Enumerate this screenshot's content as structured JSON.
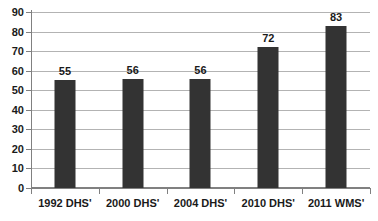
{
  "chart_data": {
    "type": "bar",
    "title": "",
    "subtitle": "",
    "xlabel": "",
    "ylabel": "",
    "categories": [
      "1992 DHS'",
      "2000 DHS'",
      "2004 DHS'",
      "2010 DHS'",
      "2011 WMS'"
    ],
    "values": [
      55,
      56,
      56,
      72,
      83
    ],
    "data_labels": [
      "55",
      "56",
      "56",
      "72",
      "83"
    ],
    "ylim": [
      0,
      90
    ],
    "ytick_step": 10,
    "yticks": [
      "0",
      "10",
      "20",
      "30",
      "40",
      "50",
      "60",
      "70",
      "80",
      "90"
    ],
    "grid": true,
    "grid_axis": "y",
    "legend": false,
    "legend_position": "none",
    "series": [
      {
        "name": "",
        "values": [
          55,
          56,
          56,
          72,
          83
        ]
      }
    ]
  },
  "style": {
    "bar_color": "#333333",
    "gridline_color": "#b3b3b3",
    "axis_color": "#808080",
    "text_color": "#1a1a1a",
    "background": "#ffffff"
  }
}
